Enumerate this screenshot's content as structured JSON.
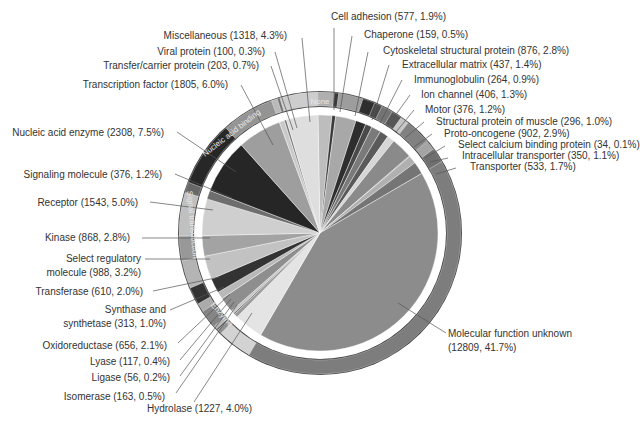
{
  "chart_data": {
    "type": "pie",
    "title": "",
    "total_note": "Counts with percentages of total proteins",
    "slices": [
      {
        "label": "Cell adhesion",
        "count": 577,
        "percent": 1.9,
        "group": "None",
        "color": "#bdbdbd"
      },
      {
        "label": "Chaperone",
        "count": 159,
        "percent": 0.5,
        "group": "None",
        "color": "#3a3a3a"
      },
      {
        "label": "Cytoskeletal structural protein",
        "count": 876,
        "percent": 2.8,
        "group": "None",
        "color": "#a8a8a8"
      },
      {
        "label": "Extracellular matrix",
        "count": 437,
        "percent": 1.4,
        "group": "None",
        "color": "#2e2e2e"
      },
      {
        "label": "Immunoglobulin",
        "count": 264,
        "percent": 0.9,
        "group": "None",
        "color": "#4a4a4a"
      },
      {
        "label": "Ion channel",
        "count": 406,
        "percent": 1.3,
        "group": "None",
        "color": "#7a7a7a"
      },
      {
        "label": "Motor",
        "count": 376,
        "percent": 1.2,
        "group": "None",
        "color": "#5a5a5a"
      },
      {
        "label": "Structural protein of muscle",
        "count": 296,
        "percent": 1.0,
        "group": "None",
        "color": "#d6d6d6"
      },
      {
        "label": "Proto-oncogene",
        "count": 902,
        "percent": 2.9,
        "group": "None",
        "color": "#8a8a8a"
      },
      {
        "label": "Select calcium binding protein",
        "count": 34,
        "percent": 0.1,
        "group": "None",
        "color": "#6a6a6a"
      },
      {
        "label": "Intracellular transporter",
        "count": 350,
        "percent": 1.1,
        "group": "None",
        "color": "#b0b0b0"
      },
      {
        "label": "Transporter",
        "count": 533,
        "percent": 1.7,
        "group": "None",
        "color": "#757575"
      },
      {
        "label": "Molecular function unknown",
        "count": 12809,
        "percent": 41.7,
        "group": "Unknown",
        "color": "#8c8c8c"
      },
      {
        "label": "Hydrolase",
        "count": 1227,
        "percent": 4.0,
        "group": "Enzyme",
        "color": "#e4e4e4"
      },
      {
        "label": "Isomerase",
        "count": 163,
        "percent": 0.5,
        "group": "Enzyme",
        "color": "#9a9a9a"
      },
      {
        "label": "Ligase",
        "count": 56,
        "percent": 0.2,
        "group": "Enzyme",
        "color": "#666666"
      },
      {
        "label": "Lyase",
        "count": 117,
        "percent": 0.4,
        "group": "Enzyme",
        "color": "#c4c4c4"
      },
      {
        "label": "Oxidoreductase",
        "count": 656,
        "percent": 2.1,
        "group": "Enzyme",
        "color": "#8e8e8e"
      },
      {
        "label": "Synthase and synthetase",
        "count": 313,
        "percent": 1.0,
        "group": "Enzyme",
        "color": "#b8b8b8"
      },
      {
        "label": "Transferase",
        "count": 610,
        "percent": 2.0,
        "group": "Signal transduction",
        "color": "#333333"
      },
      {
        "label": "Select regulatory molecule",
        "count": 988,
        "percent": 3.2,
        "group": "Signal transduction",
        "color": "#c2c2c2"
      },
      {
        "label": "Kinase",
        "count": 868,
        "percent": 2.8,
        "group": "Signal transduction",
        "color": "#a3a3a3"
      },
      {
        "label": "Receptor",
        "count": 1543,
        "percent": 5.0,
        "group": "Signal transduction",
        "color": "#cfcfcf"
      },
      {
        "label": "Signaling molecule",
        "count": 376,
        "percent": 1.2,
        "group": "Signal transduction",
        "color": "#6e6e6e"
      },
      {
        "label": "Nucleic acid enzyme",
        "count": 2308,
        "percent": 7.5,
        "group": "Nucleic acid binding",
        "color": "#262626"
      },
      {
        "label": "Transcription factor",
        "count": 1805,
        "percent": 6.0,
        "group": "Nucleic acid binding",
        "color": "#9e9e9e"
      },
      {
        "label": "Transfer/carrier protein",
        "count": 203,
        "percent": 0.7,
        "group": "None",
        "color": "#c9c9c9"
      },
      {
        "label": "Viral protein",
        "count": 100,
        "percent": 0.3,
        "group": "None",
        "color": "#777777"
      },
      {
        "label": "Miscellaneous",
        "count": 1318,
        "percent": 4.3,
        "group": "None",
        "color": "#dedede"
      }
    ],
    "outer_ring": [
      {
        "label": "None"
      },
      {
        "label": "Nucleic acid binding"
      },
      {
        "label": "Signal transduction"
      },
      {
        "label": "Enzyme"
      }
    ],
    "legend_position": "callout labels around pie"
  },
  "labels": [
    {
      "text": "Cell adhesion (577, 1.9%)",
      "x": 331,
      "y": 20,
      "anchor": "start",
      "lx": 334,
      "ly": 28,
      "px": 334,
      "py": 110
    },
    {
      "text": "Chaperone (159, 0.5%)",
      "x": 364,
      "y": 38,
      "anchor": "start",
      "lx": 352,
      "ly": 36,
      "px": 340,
      "py": 112
    },
    {
      "text": "Cytoskeletal structural protein (876, 2.8%)",
      "x": 383,
      "y": 54,
      "anchor": "start",
      "lx": 368,
      "ly": 52,
      "px": 355,
      "py": 116
    },
    {
      "text": "Extracellular matrix (437, 1.4%)",
      "x": 402,
      "y": 68,
      "anchor": "start",
      "lx": 389,
      "ly": 65,
      "px": 372,
      "py": 120
    },
    {
      "text": "Immunoglobulin (264, 0.9%)",
      "x": 414,
      "y": 83,
      "anchor": "start",
      "lx": 402,
      "ly": 80,
      "px": 380,
      "py": 123
    },
    {
      "text": "Ion channel (406, 1.3%)",
      "x": 421,
      "y": 98,
      "anchor": "start",
      "lx": 410,
      "ly": 95,
      "px": 387,
      "py": 127
    },
    {
      "text": "Motor (376, 1.2%)",
      "x": 425,
      "y": 113,
      "anchor": "start",
      "lx": 414,
      "ly": 110,
      "px": 396,
      "py": 132
    },
    {
      "text": "Structural protein of muscle (296, 1.0%)",
      "x": 436,
      "y": 125,
      "anchor": "start",
      "lx": 424,
      "ly": 122,
      "px": 405,
      "py": 138
    },
    {
      "text": "Proto-oncogene (902, 2.9%)",
      "x": 444,
      "y": 137,
      "anchor": "start",
      "lx": 432,
      "ly": 134,
      "px": 414,
      "py": 147
    },
    {
      "text": "Select calcium binding protein (34, 0.1%)",
      "x": 458,
      "y": 148,
      "anchor": "start",
      "lx": 445,
      "ly": 146,
      "px": 425,
      "py": 158
    },
    {
      "text": "Intracellular transporter (350, 1.1%)",
      "x": 462,
      "y": 159,
      "anchor": "start",
      "lx": 448,
      "ly": 158,
      "px": 430,
      "py": 162
    },
    {
      "text": "Transporter (533, 1.7%)",
      "x": 470,
      "y": 170,
      "anchor": "start",
      "lx": 456,
      "ly": 168,
      "px": 436,
      "py": 174
    },
    {
      "text": "Molecular function unknown",
      "x": 448,
      "y": 337,
      "anchor": "start",
      "lx": 446,
      "ly": 333,
      "px": 398,
      "py": 303
    },
    {
      "text": "(12809, 41.7%)",
      "x": 448,
      "y": 351,
      "anchor": "start"
    },
    {
      "text": "Hydrolase (1227, 4.0%)",
      "x": 147,
      "y": 412,
      "anchor": "start",
      "lx": 194,
      "ly": 402,
      "px": 252,
      "py": 313
    },
    {
      "text": "Isomerase (163, 0.5%)",
      "x": 165,
      "y": 400,
      "anchor": "end",
      "lx": 176,
      "ly": 393,
      "px": 237,
      "py": 305
    },
    {
      "text": "Ligase (56, 0.2%)",
      "x": 170,
      "y": 381,
      "anchor": "end",
      "lx": 180,
      "ly": 376,
      "px": 234,
      "py": 302
    },
    {
      "text": "Lyase (117, 0.4%)",
      "x": 170,
      "y": 365,
      "anchor": "end",
      "lx": 180,
      "ly": 360,
      "px": 231,
      "py": 299
    },
    {
      "text": "Oxidoreductase (656, 2.1%)",
      "x": 167,
      "y": 349,
      "anchor": "end",
      "lx": 178,
      "ly": 343,
      "px": 230,
      "py": 294
    },
    {
      "text": "Synthase and",
      "x": 166,
      "y": 313,
      "anchor": "end",
      "lx": 170,
      "ly": 310,
      "px": 224,
      "py": 287
    },
    {
      "text": "synthetase (313, 1.0%)",
      "x": 166,
      "y": 327,
      "anchor": "end"
    },
    {
      "text": "Transferase (610, 2.0%)",
      "x": 143,
      "y": 295,
      "anchor": "end",
      "lx": 153,
      "ly": 291,
      "px": 220,
      "py": 277
    },
    {
      "text": "Select regulatory",
      "x": 141,
      "y": 262,
      "anchor": "end",
      "lx": 145,
      "ly": 259,
      "px": 210,
      "py": 259
    },
    {
      "text": "molecule (988, 3.2%)",
      "x": 141,
      "y": 276,
      "anchor": "end"
    },
    {
      "text": "Kinase (868, 2.8%)",
      "x": 130,
      "y": 241,
      "anchor": "end",
      "lx": 142,
      "ly": 238,
      "px": 210,
      "py": 238
    },
    {
      "text": "Receptor (1543, 5.0%)",
      "x": 138,
      "y": 206,
      "anchor": "end",
      "lx": 150,
      "ly": 202,
      "px": 213,
      "py": 210
    },
    {
      "text": "Signaling molecule (376, 1.2%)",
      "x": 162,
      "y": 178,
      "anchor": "end",
      "lx": 175,
      "ly": 174,
      "px": 232,
      "py": 198
    },
    {
      "text": "Nucleic acid enzyme (2308, 7.5%)",
      "x": 164,
      "y": 136,
      "anchor": "end",
      "lx": 177,
      "ly": 132,
      "px": 236,
      "py": 172
    },
    {
      "text": "Transcription factor (1805, 6.0%)",
      "x": 228,
      "y": 88,
      "anchor": "end",
      "lx": 241,
      "ly": 85,
      "px": 273,
      "py": 145
    },
    {
      "text": "Transfer/carrier protein (203, 0.7%)",
      "x": 259,
      "y": 69,
      "anchor": "end",
      "lx": 271,
      "ly": 66,
      "px": 293,
      "py": 130
    },
    {
      "text": "Viral protein (100, 0.3%)",
      "x": 265,
      "y": 55,
      "anchor": "end",
      "lx": 275,
      "ly": 52,
      "px": 297,
      "py": 128
    },
    {
      "text": "Miscellaneous (1318, 4.3%)",
      "x": 287,
      "y": 39,
      "anchor": "end",
      "lx": 302,
      "ly": 38,
      "px": 310,
      "py": 122
    }
  ]
}
